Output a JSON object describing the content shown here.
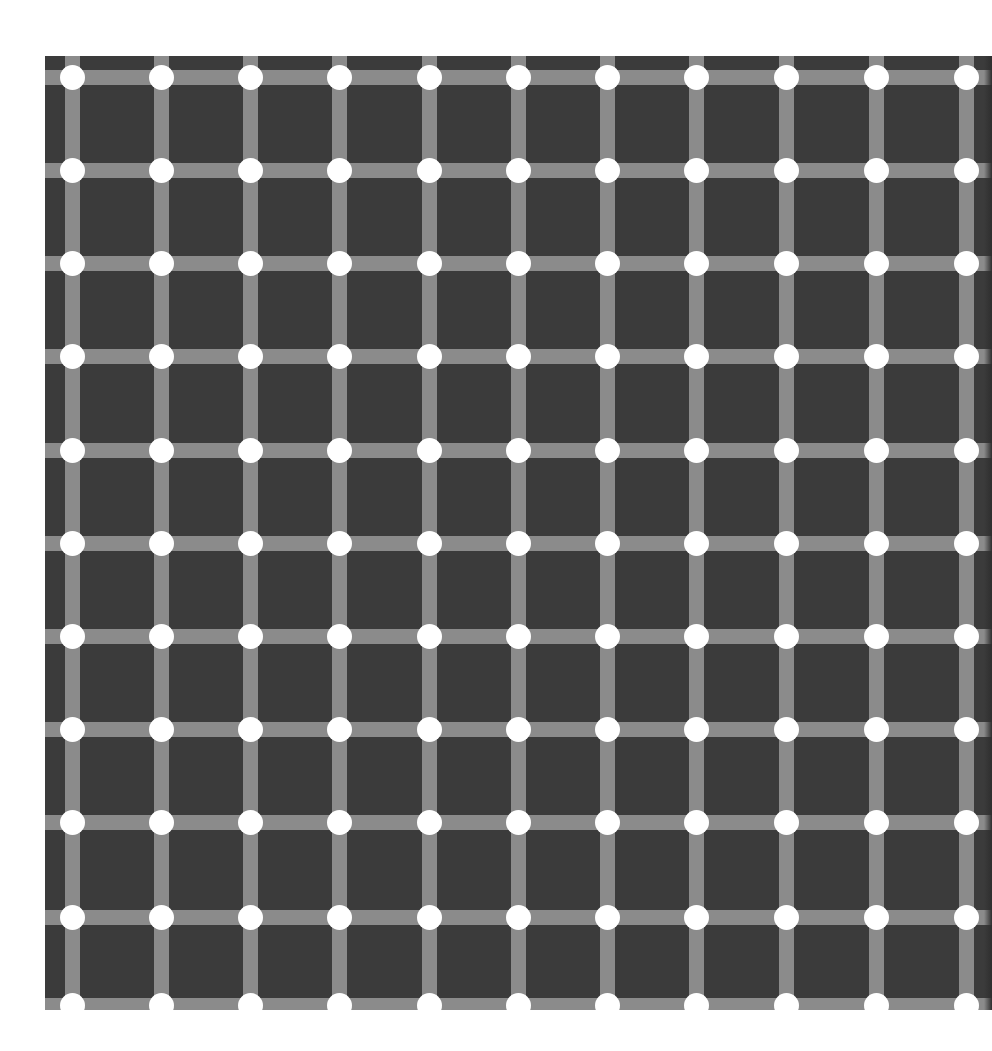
{
  "image": {
    "title": "Scintillating grid illusion",
    "description": "Dark gray square with light gray grid lines and white discs at every intersection"
  },
  "colors": {
    "page_background": "#ffffff",
    "square_fill": "#3b3b3b",
    "grid_lines": "#8b8b8b",
    "dots": "#ffffff"
  },
  "grid": {
    "left": 45,
    "top": 56,
    "width": 947,
    "height": 954,
    "line_width": 15,
    "dot_diameter": 25,
    "rows_y": [
      77,
      170,
      263,
      356,
      450,
      543,
      636,
      729,
      822,
      917,
      1005
    ],
    "cols_x": [
      72,
      161,
      250,
      339,
      429,
      518,
      607,
      696,
      786,
      876,
      966
    ]
  }
}
